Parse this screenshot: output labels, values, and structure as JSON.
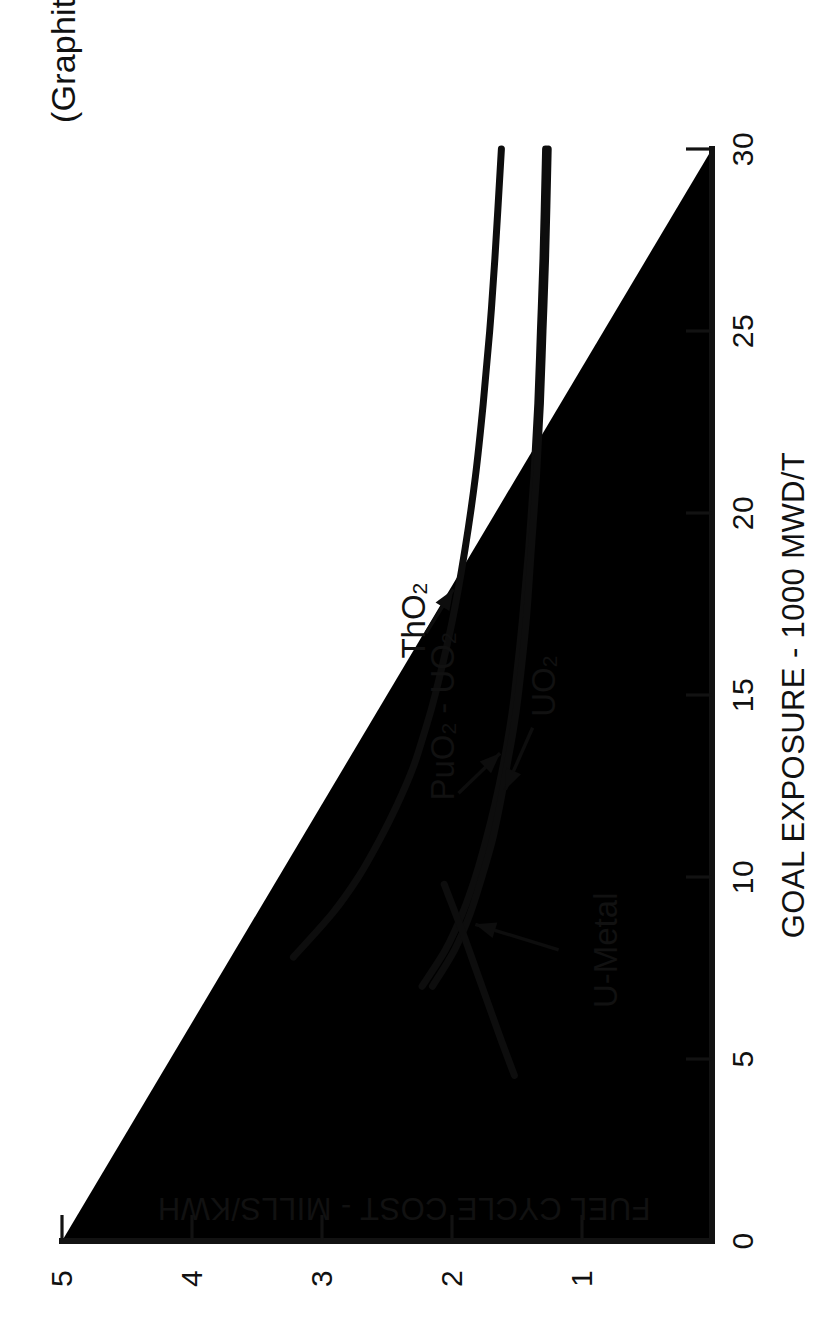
{
  "figure": {
    "title": "(Graphite Moderated Power  Reactor Concept)",
    "background": "#ffffff",
    "ink_color": "#0d0d0d"
  },
  "axes": {
    "x": {
      "label": "GOAL EXPOSURE - 1000 MWD/T",
      "ticks": [
        "0",
        "5",
        "10",
        "15",
        "20",
        "25",
        "30"
      ],
      "min": 0,
      "max": 30
    },
    "y": {
      "label": "FUEL CYCLE COST - MILLS/KWH",
      "ticks": [
        "1",
        "2",
        "3",
        "4",
        "5"
      ],
      "min": 0,
      "max": 5
    }
  },
  "annotations": [
    {
      "name": "tho2",
      "base": "ThO",
      "sub": "2",
      "suffix": ""
    },
    {
      "name": "puo2-uo2",
      "base": "PuO",
      "sub": "2",
      "suffix": " - UO₂"
    },
    {
      "name": "uo2",
      "base": "UO",
      "sub": "2",
      "suffix": ""
    },
    {
      "name": "u-metal",
      "base": "U-Metal",
      "sub": "",
      "suffix": ""
    }
  ],
  "chart_data": {
    "type": "line",
    "title": "(Graphite Moderated Power  Reactor Concept)",
    "xlabel": "GOAL EXPOSURE - 1000 MWD/T",
    "ylabel": "FUEL CYCLE COST - MILLS/KWH",
    "xlim": [
      0,
      30
    ],
    "ylim": [
      0,
      5
    ],
    "xticks": [
      0,
      5,
      10,
      15,
      20,
      25,
      30
    ],
    "yticks": [
      1,
      2,
      3,
      4,
      5
    ],
    "grid": false,
    "legend": "inline-annotations",
    "series": [
      {
        "name": "ThO2",
        "label": "ThO₂",
        "points": [
          [
            7.8,
            3.22
          ],
          [
            9.0,
            2.92
          ],
          [
            10.0,
            2.72
          ],
          [
            11.0,
            2.56
          ],
          [
            12.0,
            2.42
          ],
          [
            13.0,
            2.3
          ],
          [
            14.0,
            2.21
          ],
          [
            15.0,
            2.13
          ],
          [
            17.0,
            2.0
          ],
          [
            19.0,
            1.9
          ],
          [
            21.0,
            1.82
          ],
          [
            23.0,
            1.76
          ],
          [
            25.0,
            1.71
          ],
          [
            27.0,
            1.67
          ],
          [
            30.0,
            1.62
          ]
        ]
      },
      {
        "name": "PuO2-UO2",
        "label": "PuO₂ - UO₂",
        "points": [
          [
            7.0,
            2.23
          ],
          [
            8.0,
            2.05
          ],
          [
            9.0,
            1.92
          ],
          [
            10.0,
            1.82
          ],
          [
            11.0,
            1.74
          ],
          [
            12.0,
            1.67
          ],
          [
            13.0,
            1.61
          ],
          [
            14.0,
            1.56
          ],
          [
            15.0,
            1.52
          ],
          [
            17.0,
            1.46
          ],
          [
            19.0,
            1.41
          ],
          [
            21.0,
            1.37
          ],
          [
            23.0,
            1.34
          ],
          [
            25.0,
            1.32
          ],
          [
            27.0,
            1.3
          ],
          [
            30.0,
            1.28
          ]
        ]
      },
      {
        "name": "UO2",
        "label": "UO₂",
        "points": [
          [
            7.0,
            2.15
          ],
          [
            8.0,
            1.98
          ],
          [
            9.0,
            1.86
          ],
          [
            10.0,
            1.77
          ],
          [
            11.0,
            1.69
          ],
          [
            12.0,
            1.63
          ],
          [
            13.0,
            1.58
          ],
          [
            14.0,
            1.53
          ],
          [
            15.0,
            1.49
          ],
          [
            17.0,
            1.43
          ],
          [
            19.0,
            1.39
          ],
          [
            21.0,
            1.35
          ],
          [
            23.0,
            1.32
          ],
          [
            25.0,
            1.3
          ],
          [
            27.0,
            1.28
          ],
          [
            30.0,
            1.26
          ]
        ]
      },
      {
        "name": "U-Metal",
        "label": "U-Metal",
        "points": [
          [
            4.55,
            1.52
          ],
          [
            5.5,
            1.62
          ],
          [
            6.5,
            1.72
          ],
          [
            7.5,
            1.82
          ],
          [
            8.5,
            1.92
          ],
          [
            9.8,
            2.06
          ]
        ]
      }
    ]
  }
}
